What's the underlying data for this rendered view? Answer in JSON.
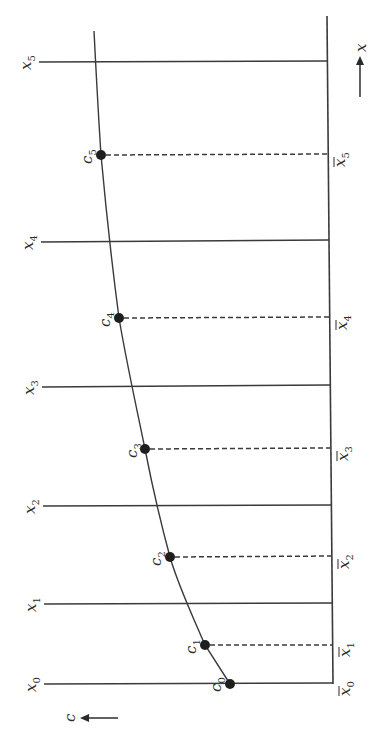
{
  "figure": {
    "orientation": "rotated-90-ccw",
    "axis_labels": {
      "x_arrow_label": "x",
      "c_arrow_label": "c"
    },
    "grid_lines": [
      {
        "label": "x",
        "sub": "0",
        "y": 684
      },
      {
        "label": "x",
        "sub": "1",
        "y": 604
      },
      {
        "label": "x",
        "sub": "2",
        "y": 505
      },
      {
        "label": "x",
        "sub": "3",
        "y": 386
      },
      {
        "label": "x",
        "sub": "4",
        "y": 241
      },
      {
        "label": "x",
        "sub": "5",
        "y": 62
      }
    ],
    "points": [
      {
        "label": "c",
        "sub": "0",
        "cx": 230,
        "cy": 684,
        "bar_label": "x",
        "bar_sub": "0"
      },
      {
        "label": "c",
        "sub": "1",
        "cx": 205,
        "cy": 645,
        "bar_label": "x",
        "bar_sub": "1"
      },
      {
        "label": "c",
        "sub": "2",
        "cx": 170,
        "cy": 557,
        "bar_label": "x",
        "bar_sub": "2"
      },
      {
        "label": "c",
        "sub": "3",
        "cx": 145,
        "cy": 449,
        "bar_label": "x",
        "bar_sub": "3"
      },
      {
        "label": "c",
        "sub": "4",
        "cx": 119,
        "cy": 318,
        "bar_label": "x",
        "bar_sub": "4"
      },
      {
        "label": "c",
        "sub": "5",
        "cx": 101,
        "cy": 155,
        "bar_label": "x",
        "bar_sub": "5"
      }
    ],
    "colors": {
      "ink": "#3a3a3a",
      "dot": "#1e1e1e",
      "background": "#ffffff"
    }
  }
}
